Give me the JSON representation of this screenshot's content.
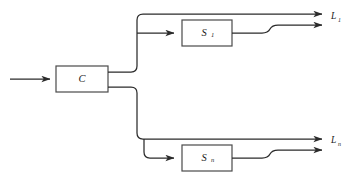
{
  "diagram": {
    "type": "block-diagram",
    "title": "",
    "background_color": "#ffffff",
    "line_color": "#2b2b2b",
    "box_fill": "#ffffff",
    "box_stroke": "#4a4a4a",
    "blocks": [
      {
        "id": "controller",
        "label": "C",
        "subscript": "",
        "x": 56,
        "y": 66,
        "w": 52,
        "h": 26
      },
      {
        "id": "stage-1",
        "label": "S",
        "subscript": "1",
        "x": 182,
        "y": 20,
        "w": 50,
        "h": 26
      },
      {
        "id": "stage-n",
        "label": "S",
        "subscript": "n",
        "x": 182,
        "y": 145,
        "w": 50,
        "h": 26
      }
    ],
    "output_labels": [
      {
        "id": "output-1",
        "label": "L",
        "subscript": "1",
        "x": 329,
        "y": 16
      },
      {
        "id": "output-n",
        "label": "L",
        "subscript": "n",
        "x": 329,
        "y": 136
      }
    ],
    "input": {
      "id": "system-input",
      "arrow": "right-arrow"
    },
    "arrowheads": [
      "input-arrowhead",
      "stage-1-input-arrowhead",
      "stage-n-input-arrowhead",
      "output-1-upper-arrowhead",
      "output-1-lower-arrowhead",
      "output-n-upper-arrowhead",
      "output-n-lower-arrowhead"
    ]
  }
}
